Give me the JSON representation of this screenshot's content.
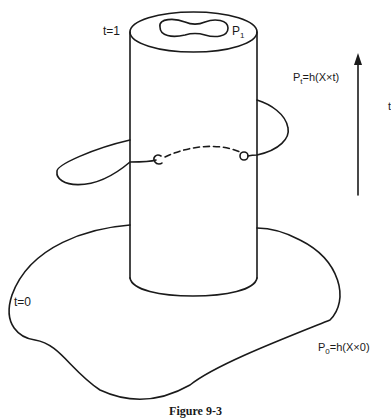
{
  "figure": {
    "caption": "Figure 9-3",
    "labels": {
      "t_top": "t=1",
      "p1_main": "P",
      "p1_sub": "1",
      "pt_main": "P",
      "pt_sub": "t",
      "pt_rest": "=h(X×t)",
      "t_bottom": "t=0",
      "p0_main": "P",
      "p0_sub": "0",
      "p0_rest": "=h(X×0)",
      "arrow_edge": "t"
    },
    "stroke_color": "#1a1a1a",
    "background": "#ffffff"
  }
}
